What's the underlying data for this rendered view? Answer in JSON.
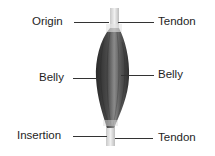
{
  "diagram": {
    "labels": {
      "origin": "Origin",
      "tendon_top": "Tendon",
      "belly_left": "Belly",
      "belly_right": "Belly",
      "insertion": "Insertion",
      "tendon_bottom": "Tendon"
    },
    "colors": {
      "muscle_dark": "#2b2b2b",
      "muscle_mid": "#6a6a6a",
      "muscle_light": "#9a9a9a",
      "tendon": "#d8d8d8",
      "leader_line": "#333333"
    }
  }
}
